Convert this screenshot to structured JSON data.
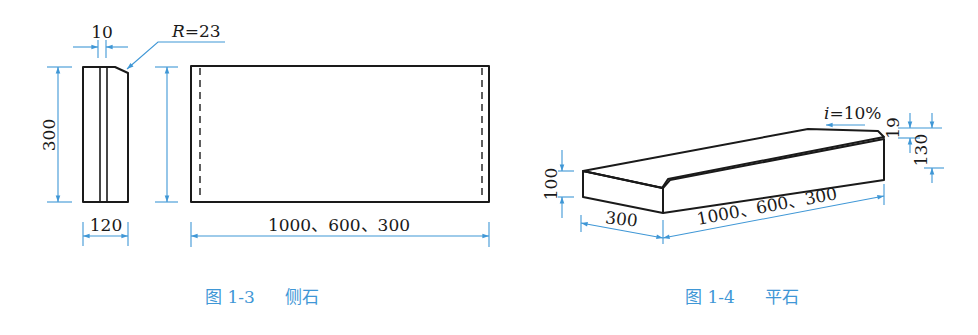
{
  "figures": [
    {
      "id": "fig-1-3",
      "caption_number": "图 1-3",
      "caption_title": "侧石",
      "side_view": {
        "width_label": "120",
        "height_label": "300",
        "groove_label": "10",
        "radius_label_prefix": "R",
        "radius_label_value": "=23"
      },
      "front_view": {
        "length_label": "1000、600、300"
      }
    },
    {
      "id": "fig-1-4",
      "caption_number": "图 1-4",
      "caption_title": "平石",
      "isometric_view": {
        "width_label": "300",
        "length_label": "1000、600、300",
        "front_height_label": "100",
        "back_height_label": "130",
        "edge_label": "19",
        "slope_label_prefix": "i",
        "slope_label_value": "=10%"
      }
    }
  ],
  "colors": {
    "dimension": "#3f97d6",
    "outline": "#1a1a1a",
    "caption": "#3f97d6"
  }
}
